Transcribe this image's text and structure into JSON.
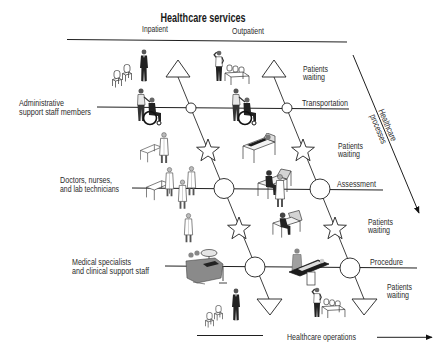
{
  "title": "Healthcare services",
  "columns": {
    "inpatient": "Inpatient",
    "outpatient": "Outpatient"
  },
  "staff_groups": [
    {
      "line1": "Administrative",
      "line2": "support staff members"
    },
    {
      "line1": "Doctors, nurses,",
      "line2": "and lab technicians"
    },
    {
      "line1": "Medical specialists",
      "line2": "and clinical support staff"
    }
  ],
  "stages": [
    {
      "label": "Transportation"
    },
    {
      "label": "Assessment"
    },
    {
      "label": "Procedure"
    }
  ],
  "waiting_labels": [
    {
      "line1": "Patients",
      "line2": "waiting"
    },
    {
      "line1": "Patients",
      "line2": "waiting"
    },
    {
      "line1": "Patients",
      "line2": "waiting"
    },
    {
      "line1": "Patients",
      "line2": "waiting"
    }
  ],
  "axes": {
    "processes": {
      "line1": "Healthcare",
      "line2": "processes"
    },
    "operations": "Healthcare operations"
  },
  "icons": {
    "waiting": "triangle-icon",
    "process_step": "circle-icon",
    "transition": "star-icon",
    "direction": "arrow-icon"
  },
  "colors": {
    "line": "#1f1f1f",
    "text": "#2b2b2b",
    "background": "#ffffff"
  }
}
